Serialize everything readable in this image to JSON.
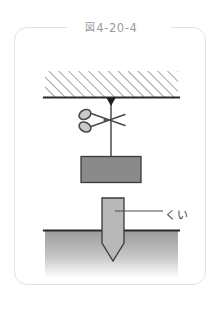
{
  "figure": {
    "caption_mark": "図",
    "caption_number": "4-20-4",
    "caption_full": "図 4-20-4"
  },
  "labels": {
    "stake": "くい"
  },
  "colors": {
    "frame_border": "#e2e2e4",
    "caption_text": "#9a9a9e",
    "ceiling_line": "#2a2a2a",
    "hatch_line": "#5a5a5a",
    "block_fill": "#8a8a8a",
    "block_stroke": "#3a3a3a",
    "string": "#1e1e1e",
    "scissors_stroke": "#4a4a4a",
    "scissors_fill": "#c9c9c9",
    "stake_fill": "#b8b8b8",
    "stake_stroke": "#3a3a3a",
    "ground_top": "#9a9a9a",
    "ground_bottom": "#ffffff",
    "ground_line": "#2a2a2a",
    "leader_line": "#4a4a4a",
    "label_text": "#3b3b3b"
  },
  "scene": {
    "ceiling": {
      "name": "hatched ceiling",
      "x": 30,
      "y": 43,
      "width": 133,
      "height": 26,
      "hatch_direction": "lower-left to upper-right"
    },
    "anchor": {
      "name": "string anchor point",
      "cx": 96,
      "cy": 70
    },
    "string": {
      "name": "suspending string",
      "x": 96,
      "y1": 70,
      "y2": 129
    },
    "scissors": {
      "name": "scissors cutting string",
      "cx": 88,
      "cy": 92,
      "orientation": "handles left, blades right"
    },
    "block": {
      "name": "suspended block",
      "x": 66,
      "y": 128,
      "width": 60,
      "height": 26
    },
    "stake": {
      "name": "stake driven into ground",
      "x": 87,
      "y": 170,
      "width": 22,
      "shaft_height": 45,
      "tip_height": 18
    },
    "ground": {
      "name": "ground with gradient shading",
      "x": 30,
      "y": 202,
      "width": 133,
      "height": 48
    },
    "leader": {
      "name": "leader line to stake label",
      "x1": 102,
      "y1": 183,
      "x2": 148,
      "y2": 183
    }
  }
}
